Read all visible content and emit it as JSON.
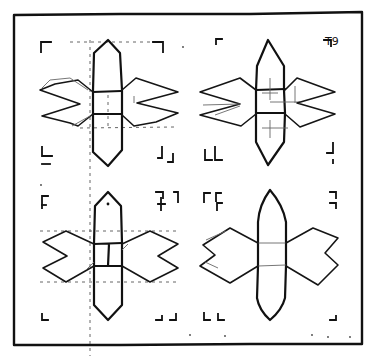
{
  "figure": {
    "type": "hand-drawn sketch",
    "ink_color": "#151515",
    "background_color": "#ffffff",
    "panels": [
      {
        "id": "top-left",
        "style": "pointed hexagonal arms, notched wings, dashed guide lines"
      },
      {
        "id": "top-right",
        "style": "pointed hexagonal arms, notched wings"
      },
      {
        "id": "bottom-left",
        "style": "pointed arms with flat sides, double-notched wings, guide lines"
      },
      {
        "id": "bottom-right",
        "style": "curved lens-shaped arms, double-notched wings"
      }
    ],
    "corner_mark_glyph": "T9"
  }
}
